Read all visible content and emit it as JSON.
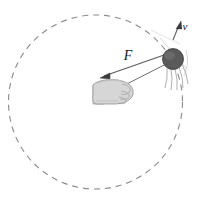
{
  "figure": {
    "background_color": "#ffffff"
  },
  "circle_path": {
    "name": "dashed-circular-path",
    "center_x": 95.5,
    "center_y": 102,
    "radius": 87,
    "stroke_color": "#8a8a8a",
    "stroke_width": 1.1,
    "dash_pattern": "6 5",
    "style": "dashed"
  },
  "ball": {
    "name": "ball",
    "center_x": 173,
    "center_y": 59,
    "radius": 10.5,
    "fill_color": "#5a5a5a",
    "highlight_color": "#6e6e6e",
    "stroke_color": "#3a3a3a"
  },
  "motion_lines": {
    "name": "motion-streak-lines",
    "count": 5,
    "stroke_color": "#9a9a9a",
    "stroke_width": 0.8
  },
  "string": {
    "name": "string",
    "from_x": 173,
    "from_y": 59,
    "to_x": 118,
    "to_y": 88,
    "stroke_color": "#6e6e6e",
    "stroke_width": 1.0
  },
  "hand": {
    "name": "hand-fist",
    "center_x": 113,
    "center_y": 93,
    "fill_color": "#d2d2d2",
    "stroke_color": "#8c8c8c",
    "shade_color": "#bcbcbc"
  },
  "force_vector": {
    "name": "force-vector-F",
    "label": "F",
    "label_x": 128,
    "label_y": 59,
    "tail_x": 167,
    "tail_y": 54,
    "tip_x": 101,
    "tip_y": 78,
    "stroke_color": "#5d5d5d",
    "stroke_width": 1.2,
    "direction": "toward center"
  },
  "velocity_vector": {
    "name": "velocity-vector-v",
    "label": "v",
    "label_x": 185,
    "label_y": 29,
    "tail_x": 172,
    "tail_y": 38,
    "tip_x": 181,
    "tip_y": 22,
    "stroke_color": "#5d5d5d",
    "stroke_width": 1.1,
    "direction": "tangent to circle"
  },
  "tangent_guides": {
    "name": "tangent-guide-arcs",
    "stroke_color": "#9a9a9a",
    "stroke_width": 0.8
  }
}
